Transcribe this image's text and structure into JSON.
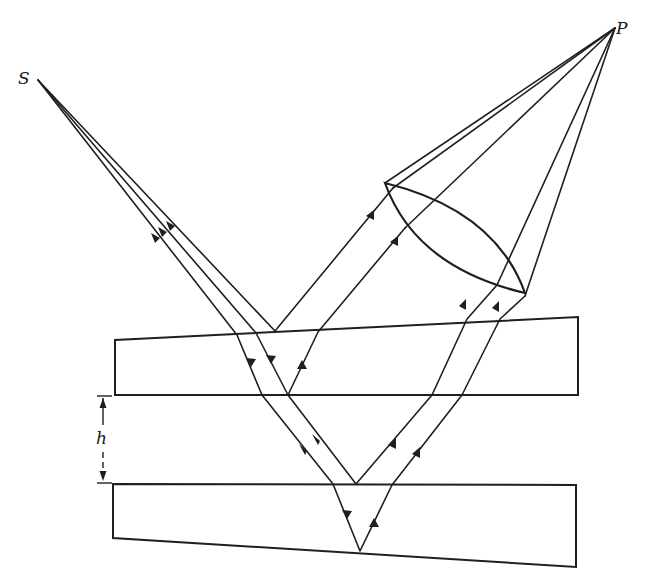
{
  "figure": {
    "labels": {
      "source": "S",
      "point": "P",
      "gap_thickness": "h"
    },
    "elements": [
      {
        "name": "source",
        "label": "S"
      },
      {
        "name": "observation-point",
        "label": "P"
      },
      {
        "name": "converging-lens"
      },
      {
        "name": "upper-glass-plate",
        "shape": "wedge"
      },
      {
        "name": "lower-glass-plate",
        "shape": "wedge"
      },
      {
        "name": "air-gap",
        "label": "h"
      }
    ],
    "colors": {
      "ink": "#1f1f1f",
      "background": "#ffffff"
    }
  }
}
